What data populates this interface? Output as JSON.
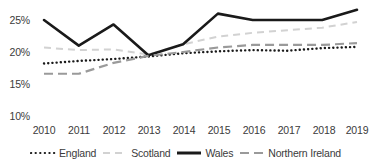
{
  "chart_data": {
    "type": "line",
    "title": "",
    "subtitle": "",
    "xlabel": "",
    "ylabel": "",
    "x": [
      2010,
      2011,
      2012,
      2013,
      2014,
      2015,
      2016,
      2017,
      2018,
      2019
    ],
    "xtick_labels": [
      "2010",
      "2011",
      "2012",
      "2013",
      "2014",
      "2015",
      "2016",
      "2017",
      "2018",
      "2019"
    ],
    "ytick_labels": [
      "25%",
      "20%",
      "15%",
      "10%"
    ],
    "ytick_values": [
      25,
      20,
      15,
      10
    ],
    "ylim": [
      10,
      27.5
    ],
    "xlim": [
      2010,
      2019
    ],
    "grid": false,
    "legend_position": "bottom",
    "series": [
      {
        "name": "England",
        "style": "dotted",
        "color": "#1a1a1a",
        "values": [
          18.2,
          18.6,
          18.9,
          19.3,
          19.8,
          20.1,
          20.3,
          20.2,
          20.6,
          20.8
        ]
      },
      {
        "name": "Scotland",
        "style": "dashed-light",
        "color": "#d2d2d2",
        "values": [
          20.7,
          20.3,
          20.4,
          19.6,
          21.2,
          22.4,
          23.0,
          23.4,
          23.8,
          24.7
        ]
      },
      {
        "name": "Wales",
        "style": "solid-thick",
        "color": "#1a1a1a",
        "values": [
          25.0,
          21.0,
          24.3,
          19.5,
          21.2,
          26.0,
          25.0,
          25.0,
          25.0,
          26.6
        ]
      },
      {
        "name": "Northern Ireland",
        "style": "dashed-grey",
        "color": "#9a9a9a",
        "values": [
          16.6,
          16.6,
          18.3,
          19.4,
          20.0,
          20.7,
          21.1,
          21.1,
          21.1,
          21.4
        ]
      }
    ]
  },
  "legend": {
    "items": [
      {
        "label": "England",
        "icon": "dotted-line-icon"
      },
      {
        "label": "Scotland",
        "icon": "light-dashed-line-icon"
      },
      {
        "label": "Wales",
        "icon": "solid-line-icon"
      },
      {
        "label": "Northern Ireland",
        "icon": "grey-dashed-line-icon"
      }
    ]
  }
}
